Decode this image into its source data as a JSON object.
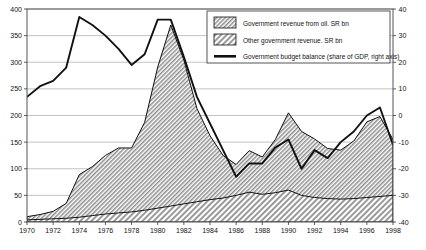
{
  "chart_data": {
    "type": "area",
    "title": "",
    "xlabel": "",
    "ylabel": "",
    "grid": true,
    "legend_position": "top-right",
    "x": [
      1970,
      1971,
      1972,
      1973,
      1974,
      1975,
      1976,
      1977,
      1978,
      1979,
      1980,
      1981,
      1982,
      1983,
      1984,
      1985,
      1986,
      1987,
      1988,
      1989,
      1990,
      1991,
      1992,
      1993,
      1994,
      1995,
      1996,
      1997,
      1998
    ],
    "xticks": [
      1970,
      1972,
      1974,
      1976,
      1978,
      1980,
      1982,
      1984,
      1986,
      1988,
      1990,
      1992,
      1994,
      1996,
      1998
    ],
    "xlim": [
      1970,
      1998
    ],
    "left_axis": {
      "label": "SR bn",
      "ylim": [
        0,
        400
      ],
      "yticks": [
        0,
        50,
        100,
        150,
        200,
        250,
        300,
        350,
        400
      ]
    },
    "right_axis": {
      "label": "share of GDP, %",
      "ylim": [
        -40,
        40
      ],
      "yticks": [
        -40,
        -30,
        -20,
        -10,
        0,
        10,
        20,
        30,
        40
      ]
    },
    "series": [
      {
        "name": "Other government revenue. SR bn",
        "axis": "left",
        "type": "area-stacked",
        "pattern": "hatch-diagonal",
        "values": [
          4,
          5,
          6,
          7,
          9,
          12,
          15,
          17,
          19,
          22,
          26,
          30,
          34,
          38,
          42,
          45,
          50,
          56,
          52,
          55,
          60,
          50,
          46,
          44,
          43,
          44,
          46,
          48,
          50
        ]
      },
      {
        "name": "Government revenue from oil. SR bn",
        "axis": "left",
        "type": "area-stacked",
        "pattern": "hatch-diagonal",
        "values": [
          6,
          9,
          14,
          28,
          80,
          92,
          110,
          122,
          120,
          165,
          265,
          340,
          270,
          175,
          120,
          80,
          58,
          78,
          70,
          100,
          145,
          120,
          110,
          94,
          92,
          108,
          142,
          150,
          105
        ]
      },
      {
        "name": "Government budget balance (share of GDP, right axis)",
        "axis": "right",
        "type": "line",
        "color": "#111111",
        "values": [
          7,
          11,
          13,
          18,
          37,
          34,
          30,
          25,
          19,
          23,
          36,
          36,
          22,
          7,
          -3,
          -13,
          -23,
          -18,
          -18,
          -12,
          -9,
          -20,
          -13,
          -16,
          -10,
          -6,
          0,
          3,
          -11
        ]
      }
    ],
    "legend": [
      {
        "label": "Government revenue from oil. SR bn",
        "swatch": "hatch-dense"
      },
      {
        "label": "Other government revenue. SR bn",
        "swatch": "hatch-diagonal"
      },
      {
        "label": "Government budget balance (share of GDP, right axis)",
        "swatch": "line-black"
      }
    ]
  },
  "caption": ""
}
